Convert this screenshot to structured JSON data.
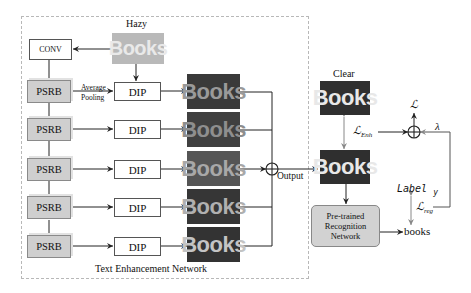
{
  "diagram": {
    "frame_title": "Text Enhancement Network",
    "input": {
      "label": "Hazy",
      "image_text": "Books",
      "image_bg": "#b9b9b9",
      "image_fg": "#e9e9e9"
    },
    "conv": {
      "label": "CONV"
    },
    "psrb_blocks": [
      {
        "label": "PSRB"
      },
      {
        "label": "PSRB"
      },
      {
        "label": "PSRB"
      },
      {
        "label": "PSRB"
      },
      {
        "label": "PSRB"
      }
    ],
    "pooling_label": {
      "line1": "Average",
      "line2": "Pooling"
    },
    "dip_blocks": [
      {
        "label": "DIP"
      },
      {
        "label": "DIP"
      },
      {
        "label": "DIP"
      },
      {
        "label": "DIP"
      },
      {
        "label": "DIP"
      }
    ],
    "intermediate_images": [
      {
        "text": "Books",
        "bg": "#3a3a3a",
        "fg": "#9a9a9a"
      },
      {
        "text": "Books",
        "bg": "#404040",
        "fg": "#8e8e8e"
      },
      {
        "text": "Books",
        "bg": "#555555",
        "fg": "#a8a8a8"
      },
      {
        "text": "Books",
        "bg": "#363636",
        "fg": "#b0b0b0"
      },
      {
        "text": "Books",
        "bg": "#333333",
        "fg": "#c4c4c4"
      }
    ],
    "fusion": {
      "label": "Output",
      "symbol": "⊕"
    },
    "clear": {
      "label": "Clear",
      "image_text": "Books",
      "bg": "#2f2f2f",
      "fg": "#e8e8e8"
    },
    "output_image": {
      "image_text": "Books",
      "bg": "#2f2f2f",
      "fg": "#e8e8e8"
    },
    "recognition": {
      "line1": "Pre-trained",
      "line2": "Recognition",
      "line3": "Network"
    },
    "prediction": "books",
    "loss": {
      "enh_symbol": "ℒ",
      "enh_sub": "Enh",
      "total_symbol": "ℒ",
      "lambda": "λ",
      "reg_symbol": "ℒ",
      "reg_sub": "reg",
      "label_text": "Label",
      "label_var": "y",
      "sum_symbol": "⊕"
    }
  }
}
